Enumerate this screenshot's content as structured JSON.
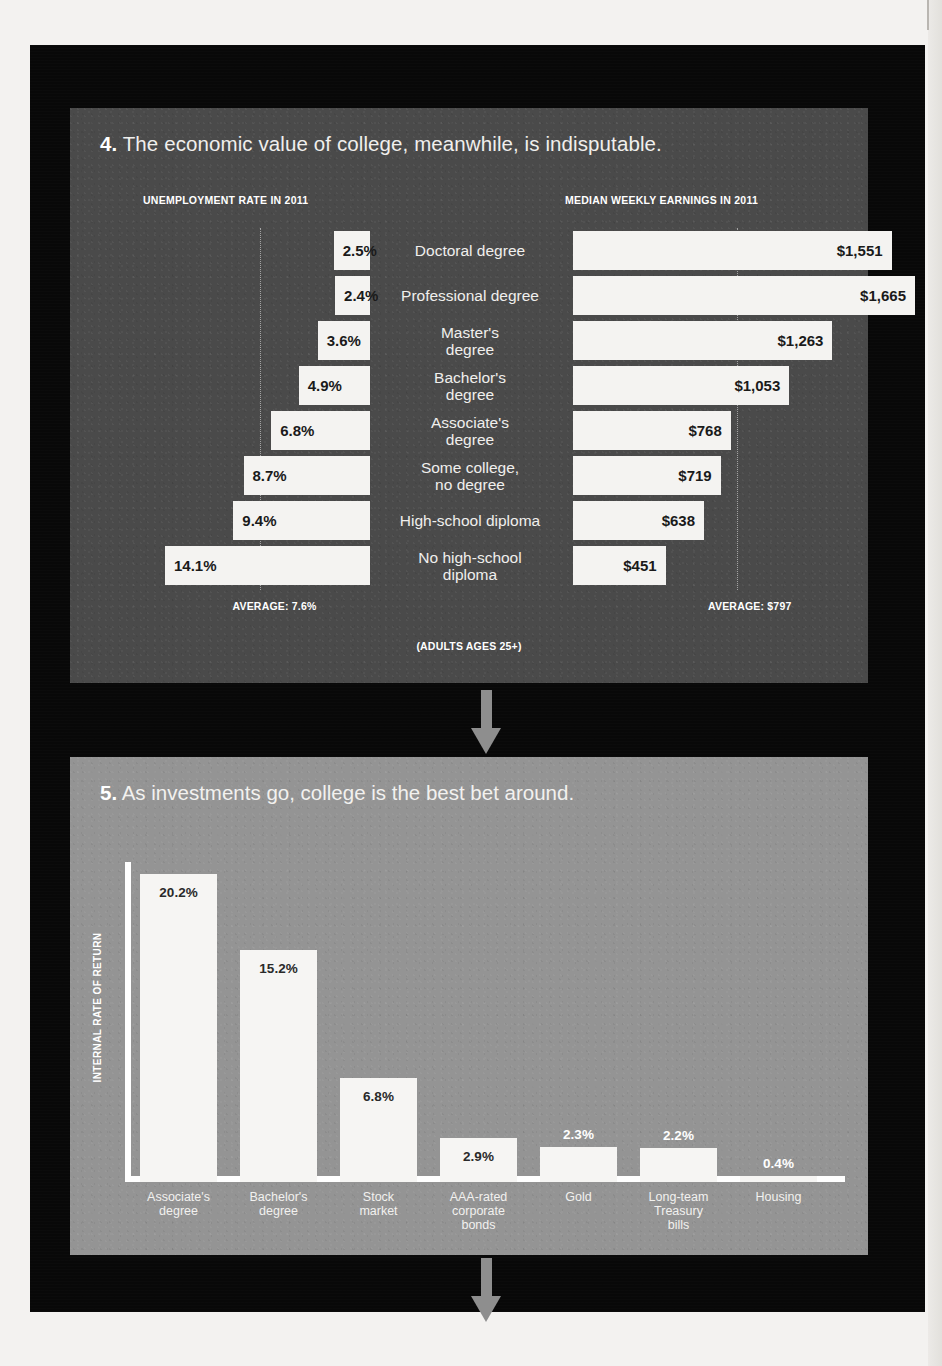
{
  "panel4": {
    "number": "4.",
    "title": "The economic value of college, meanwhile, is indisputable.",
    "left_header": "UNEMPLOYMENT RATE IN 2011",
    "right_header": "MEDIAN WEEKLY EARNINGS IN 2011",
    "left_average_label": "AVERAGE: 7.6%",
    "right_average_label": "AVERAGE: $797",
    "footnote": "(ADULTS AGES 25+)"
  },
  "panel5": {
    "number": "5.",
    "title": "As investments go, college is the best bet around.",
    "axis_title": "INTERNAL RATE OF RETURN"
  },
  "chart_data": [
    {
      "type": "bar",
      "orientation": "horizontal-diverging",
      "title": "The economic value of college, meanwhile, is indisputable.",
      "categories": [
        "Doctoral degree",
        "Professional degree",
        "Master's degree",
        "Bachelor's degree",
        "Associate's degree",
        "Some college, no degree",
        "High-school diploma",
        "No high-school diploma"
      ],
      "category_lines": [
        [
          "Doctoral degree"
        ],
        [
          "Professional degree"
        ],
        [
          "Master's",
          "degree"
        ],
        [
          "Bachelor's",
          "degree"
        ],
        [
          "Associate's",
          "degree"
        ],
        [
          "Some college,",
          "no degree"
        ],
        [
          "High-school diploma"
        ],
        [
          "No high-school",
          "diploma"
        ]
      ],
      "series": [
        {
          "name": "UNEMPLOYMENT RATE IN 2011",
          "side": "left",
          "unit": "%",
          "values": [
            2.5,
            2.4,
            3.6,
            4.9,
            6.8,
            8.7,
            9.4,
            14.1
          ],
          "labels": [
            "2.5%",
            "2.4%",
            "3.6%",
            "4.9%",
            "6.8%",
            "8.7%",
            "9.4%",
            "14.1%"
          ],
          "average": 7.6,
          "average_label": "AVERAGE: 7.6%",
          "max": 14.1
        },
        {
          "name": "MEDIAN WEEKLY EARNINGS IN 2011",
          "side": "right",
          "unit": "$",
          "values": [
            1551,
            1665,
            1263,
            1053,
            768,
            719,
            638,
            451
          ],
          "labels": [
            "$1,551",
            "$1,665",
            "$1,263",
            "$1,053",
            "$768",
            "$719",
            "$638",
            "$451"
          ],
          "average": 797,
          "average_label": "AVERAGE: $797",
          "max": 1665
        }
      ],
      "note": "(ADULTS AGES 25+)",
      "grid": false,
      "legend": "none"
    },
    {
      "type": "bar",
      "orientation": "vertical",
      "title": "As investments go, college is the best bet around.",
      "ylabel": "INTERNAL RATE OF RETURN",
      "xlabel": "",
      "ylim": [
        0,
        21
      ],
      "grid": false,
      "legend": "none",
      "categories": [
        "Associate's degree",
        "Bachelor's degree",
        "Stock market",
        "AAA-rated corporate bonds",
        "Gold",
        "Long-team Treasury bills",
        "Housing"
      ],
      "category_lines": [
        [
          "Associate's",
          "degree"
        ],
        [
          "Bachelor's",
          "degree"
        ],
        [
          "Stock",
          "market"
        ],
        [
          "AAA-rated",
          "corporate",
          "bonds"
        ],
        [
          "Gold"
        ],
        [
          "Long-team",
          "Treasury",
          "bills"
        ],
        [
          "Housing"
        ]
      ],
      "values": [
        20.2,
        15.2,
        6.8,
        2.9,
        2.3,
        2.2,
        0.4
      ],
      "labels": [
        "20.2%",
        "15.2%",
        "6.8%",
        "2.9%",
        "2.3%",
        "2.2%",
        "0.4%"
      ],
      "label_placement": [
        "inside",
        "inside",
        "inside",
        "inside",
        "outside",
        "outside",
        "outside"
      ]
    }
  ],
  "colors": {
    "page_background": "#f3f2f0",
    "field_background": "#080808",
    "panel4_background": "#4a4a4a",
    "panel5_background": "#949494",
    "bar_fill": "#f4f3f1",
    "arrow": "#8e8e8e",
    "text_light": "#f0efed",
    "text_dark": "#1a1a1a"
  }
}
